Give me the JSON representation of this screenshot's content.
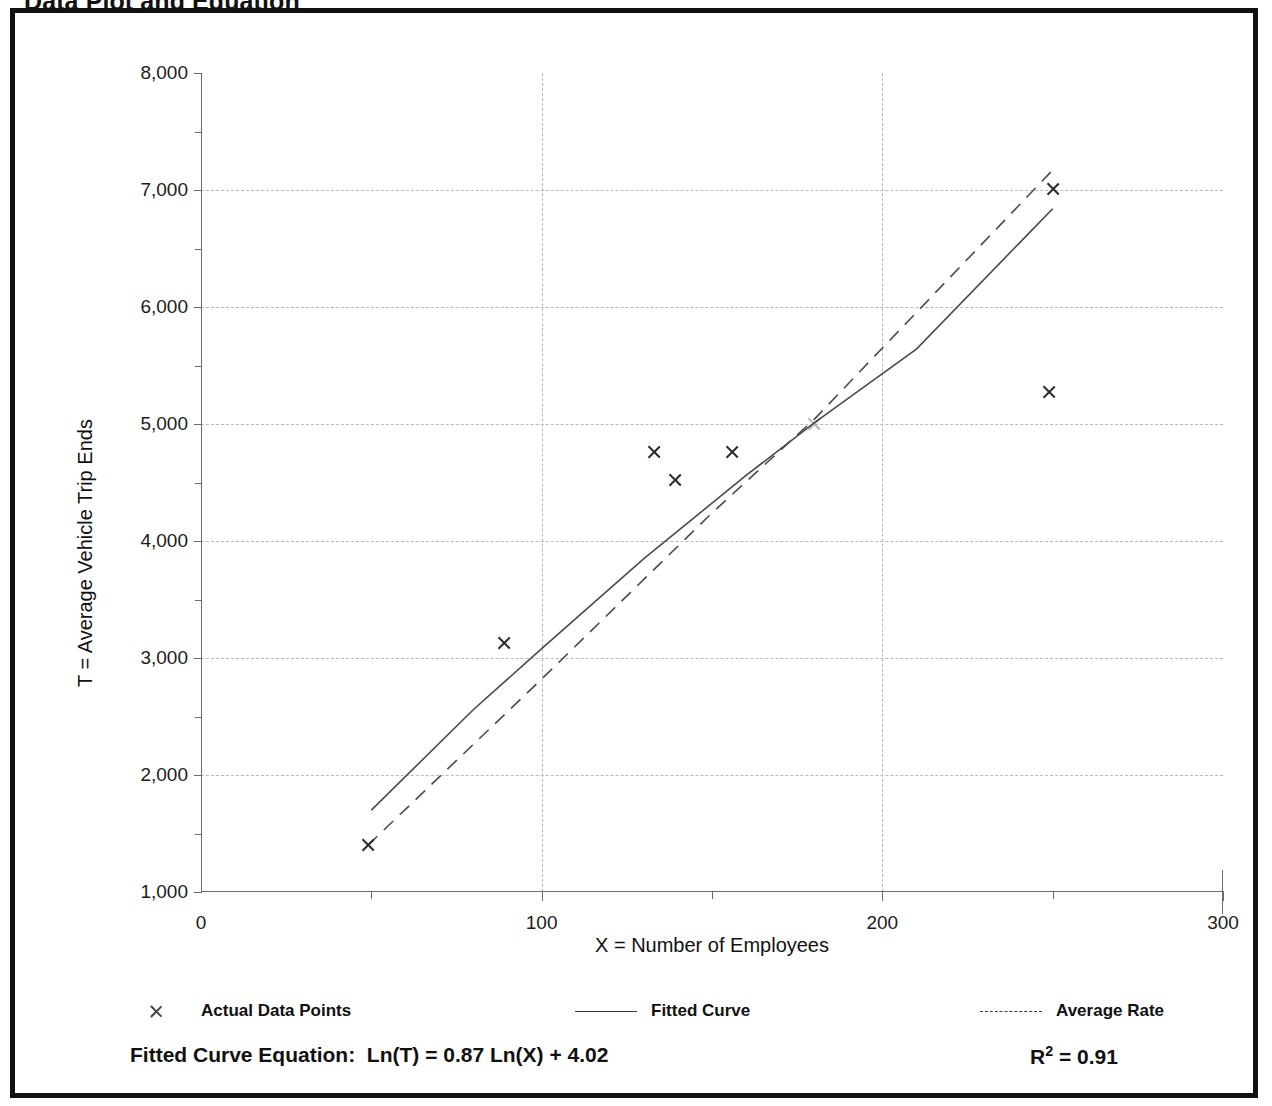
{
  "title": "Data Plot and Equation",
  "axes": {
    "y_title": "T = Average Vehicle Trip Ends",
    "x_title": "X = Number of Employees",
    "y_ticks": [
      "1,000",
      "2,000",
      "3,000",
      "4,000",
      "5,000",
      "6,000",
      "7,000",
      "8,000"
    ],
    "x_ticks": [
      "0",
      "100",
      "200",
      "300"
    ]
  },
  "legend": {
    "items": [
      {
        "label": "Actual Data Points",
        "marker": "x-marker-icon"
      },
      {
        "label": "Fitted Curve",
        "marker": "solid-line-icon"
      },
      {
        "label": "Average Rate",
        "marker": "dashed-line-icon"
      }
    ]
  },
  "equation": {
    "prefix": "Fitted Curve Equation:",
    "formula": "Ln(T) = 0.87 Ln(X) + 4.02",
    "rsq_symbol": "R",
    "rsq_exponent": "2",
    "rsq_value": "= 0.91"
  },
  "chart_data": {
    "type": "scatter",
    "title": "Data Plot and Equation",
    "xlabel": "X = Number of Employees",
    "ylabel": "T = Average Vehicle Trip Ends",
    "xlim": [
      0,
      300
    ],
    "ylim": [
      1000,
      8000
    ],
    "x_major_step": 100,
    "x_minor_step": 50,
    "y_major_step": 1000,
    "y_minor_step": 500,
    "grid": true,
    "legend_position": "below-axis",
    "series": [
      {
        "name": "Actual Data Points",
        "type": "scatter",
        "marker": "x",
        "points": [
          {
            "x": 49,
            "y": 1400
          },
          {
            "x": 89,
            "y": 3130
          },
          {
            "x": 133,
            "y": 4760
          },
          {
            "x": 139,
            "y": 4520
          },
          {
            "x": 156,
            "y": 4760
          },
          {
            "x": 180,
            "y": 5000,
            "faint": true
          },
          {
            "x": 249,
            "y": 5270
          },
          {
            "x": 250,
            "y": 7010
          }
        ]
      },
      {
        "name": "Fitted Curve",
        "type": "line",
        "style": "solid",
        "equation": "Ln(T) = 0.87 Ln(X) + 4.02",
        "r_squared": 0.91,
        "points": [
          {
            "x": 50,
            "y": 1700
          },
          {
            "x": 80,
            "y": 2560
          },
          {
            "x": 100,
            "y": 3080
          },
          {
            "x": 130,
            "y": 3850
          },
          {
            "x": 160,
            "y": 4560
          },
          {
            "x": 180,
            "y": 5010
          },
          {
            "x": 210,
            "y": 5640
          },
          {
            "x": 250,
            "y": 6840
          }
        ]
      },
      {
        "name": "Average Rate",
        "type": "line",
        "style": "dashed",
        "points": [
          {
            "x": 49,
            "y": 1400
          },
          {
            "x": 100,
            "y": 2820
          },
          {
            "x": 150,
            "y": 4240
          },
          {
            "x": 180,
            "y": 5040
          },
          {
            "x": 250,
            "y": 7170
          }
        ]
      }
    ]
  }
}
